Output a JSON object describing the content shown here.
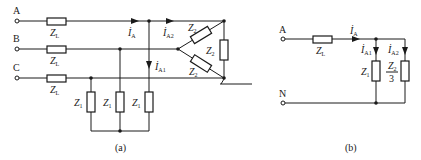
{
  "figure": {
    "a": {
      "caption": "(a)",
      "terminals": [
        "A",
        "B",
        "C"
      ],
      "line_impedance": {
        "sym": "Z",
        "sub": "L"
      },
      "load1_impedance": {
        "sym": "Z",
        "sub": "1"
      },
      "load2_impedance": {
        "sym": "Z",
        "sub": "2"
      },
      "currents": {
        "ia": {
          "sym": "İ",
          "sub": "A"
        },
        "ia1": {
          "sym": "İ",
          "sub": "A1"
        },
        "ia2": {
          "sym": "İ",
          "sub": "A2"
        }
      }
    },
    "b": {
      "caption": "(b)",
      "terminals": [
        "A",
        "N"
      ],
      "line_impedance": {
        "sym": "Z",
        "sub": "L"
      },
      "load1_impedance": {
        "sym": "Z",
        "sub": "1"
      },
      "load2_impedance": {
        "num_sym": "Z",
        "num_sub": "2",
        "den": "3"
      },
      "currents": {
        "ia": {
          "sym": "İ",
          "sub": "A"
        },
        "ia1": {
          "sym": "İ",
          "sub": "A1"
        },
        "ia2": {
          "sym": "İ",
          "sub": "A2"
        }
      }
    }
  },
  "colors": {
    "stroke": "#1a1a1a",
    "background": "#ffffff"
  }
}
